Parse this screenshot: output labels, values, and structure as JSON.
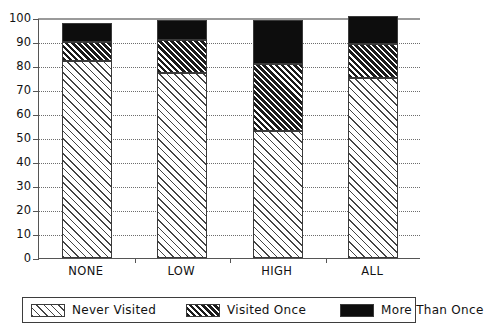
{
  "chart_data": {
    "type": "bar",
    "stacked": true,
    "title": "",
    "subtitle": "",
    "xlabel": "",
    "ylabel": "",
    "categories": [
      "NONE",
      "LOW",
      "HIGH",
      "ALL"
    ],
    "ylim": [
      0,
      100
    ],
    "ytick_labels": [
      "0",
      "10",
      "20",
      "30",
      "40",
      "50",
      "60",
      "70",
      "80",
      "90",
      "100"
    ],
    "ytick_values": [
      0,
      10,
      20,
      30,
      40,
      50,
      60,
      70,
      80,
      90,
      100
    ],
    "grid": true,
    "grid_axis": "y",
    "legend_position": "bottom",
    "series": [
      {
        "name": "Never Visited",
        "pattern": "diagonal-hatch-sparse",
        "values": [
          82,
          77,
          53,
          75
        ]
      },
      {
        "name": "Visited Once",
        "pattern": "diagonal-hatch-dense",
        "values": [
          8,
          14,
          28,
          14
        ]
      },
      {
        "name": "More Than Once",
        "pattern": "solid-black",
        "values": [
          8,
          8,
          18,
          12
        ]
      }
    ],
    "cumulative_tops": [
      [
        82,
        90,
        98
      ],
      [
        77,
        91,
        99
      ],
      [
        53,
        81,
        99
      ],
      [
        75,
        89,
        101
      ]
    ]
  },
  "legend": {
    "entries": [
      {
        "label": "Never Visited"
      },
      {
        "label": "Visited Once"
      },
      {
        "label": "More Than Once"
      }
    ]
  },
  "colors": {
    "axis": "#555555",
    "grid": "#6d6d6d",
    "hatch_light": "#444444",
    "hatch_dark": "#1c1c1c",
    "solid": "#0d0d0d",
    "background": "#ffffff",
    "text": "#111111"
  }
}
